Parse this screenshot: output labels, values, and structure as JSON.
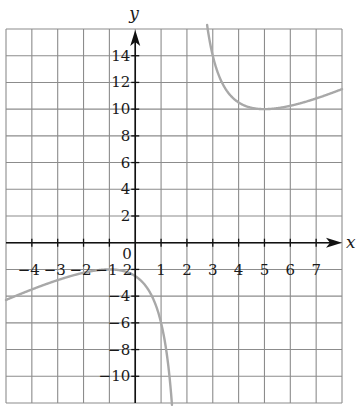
{
  "chart_data": {
    "type": "line",
    "title": "",
    "xlabel": "x",
    "ylabel": "y",
    "function": "f(x) = (x^2 + 5)/(x - 2) = x + 2 + 9/(x - 2)",
    "xlim": [
      -5,
      8
    ],
    "ylim": [
      -12,
      16
    ],
    "grid": true,
    "grid_step": {
      "x": 1,
      "y": 2
    },
    "vertical_asymptote": 2,
    "x_ticks": [
      -4,
      -3,
      -2,
      -1,
      1,
      2,
      3,
      4,
      5,
      6,
      7
    ],
    "y_ticks": [
      14,
      12,
      10,
      8,
      6,
      4,
      2,
      -2,
      -4,
      -6,
      -8,
      -10
    ],
    "origin_label": "0",
    "key_points": [
      {
        "x": -1,
        "y": -2,
        "note": "local maximum"
      },
      {
        "x": 5,
        "y": 10,
        "note": "local minimum"
      },
      {
        "x": 1,
        "y": -6
      },
      {
        "x": -5,
        "y": -4.29
      },
      {
        "x": 8,
        "y": 11.5
      }
    ],
    "series": [
      {
        "name": "left branch",
        "x": [
          -5,
          -4,
          -3,
          -2,
          -1,
          0,
          0.5,
          1,
          1.2,
          1.4
        ],
        "values": [
          -4.29,
          -3.5,
          -2.8,
          -2.25,
          -2,
          -2.5,
          -3.5,
          -6,
          -8.45,
          -11.6
        ]
      },
      {
        "name": "right branch",
        "x": [
          2.8,
          3,
          3.5,
          4,
          5,
          6,
          7,
          8
        ],
        "values": [
          16.05,
          14,
          11.5,
          10.5,
          10,
          10.25,
          10.8,
          11.5
        ]
      }
    ],
    "colors": {
      "grid": "#8c8c8c",
      "axis": "#111111",
      "curve": "#a8a8a8"
    }
  },
  "labels": {
    "x_axis": "x",
    "y_axis": "y",
    "origin": "0"
  }
}
